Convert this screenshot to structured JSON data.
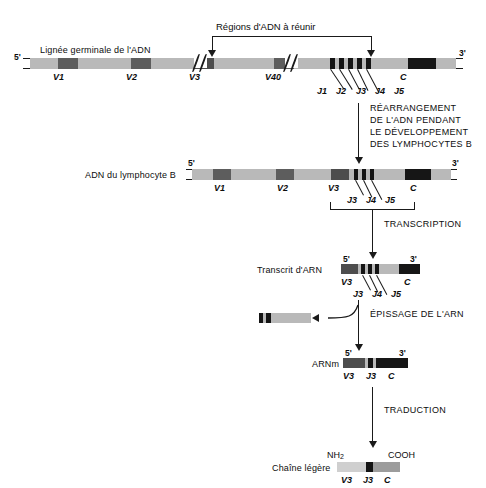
{
  "figure": {
    "language": "fr",
    "title_top": "Régions d'ADN à réunir",
    "colors": {
      "backbone": "#b9b9b9",
      "backbone_light": "#c9c9c9",
      "v_segment": "#5d5d5d",
      "j_segment": "#141414",
      "c_segment": "#161616",
      "spacer": "#a8a8a8",
      "protein_v": "#cfcfcf",
      "protein_c": "#9c9c9c",
      "ink": "#0d0d0d"
    }
  },
  "rows": {
    "germline": {
      "label": "Lignée germinale de l'ADN",
      "five_prime": "5'",
      "three_prime": "3'",
      "segments": [
        "V1",
        "V2",
        "V3",
        "V40",
        "J1",
        "J2",
        "J3",
        "J4",
        "J5",
        "C"
      ]
    },
    "bcell_dna": {
      "label": "ADN du lymphocyte B",
      "five_prime": "5'",
      "three_prime": "3'",
      "segments": [
        "V1",
        "V2",
        "V3",
        "J3",
        "J4",
        "J5",
        "C"
      ]
    },
    "rna_transcript": {
      "label": "Transcrit d'ARN",
      "five_prime": "5'",
      "three_prime": "3'",
      "segments": [
        "V3",
        "J3",
        "J4",
        "J5",
        "C"
      ]
    },
    "excised_rna": {
      "label": ""
    },
    "mrna": {
      "label": "ARNm",
      "five_prime": "5'",
      "three_prime": "3'",
      "segments": [
        "V3",
        "J3",
        "C"
      ]
    },
    "light_chain": {
      "label": "Chaîne légère",
      "n_terminus": "NH",
      "n_terminus_sub": "2",
      "c_terminus": "COOH",
      "segments": [
        "V3",
        "J3",
        "C"
      ]
    }
  },
  "steps": {
    "rearrangement": [
      "RÉARRANGEMENT",
      "DE L'ADN PENDANT",
      "LE DÉVELOPPEMENT",
      "DES LYMPHOCYTES B"
    ],
    "transcription": "TRANSCRIPTION",
    "splicing": "ÉPISSAGE DE L'ARN",
    "translation": "TRADUCTION"
  }
}
